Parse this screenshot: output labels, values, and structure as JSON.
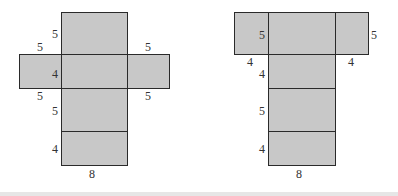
{
  "diagrams": [
    {
      "name": "net-left",
      "description": "Net of rectangular prism, cross shape",
      "fill_color": "#c8c8c8",
      "stroke_color": "#2a2a2a",
      "labels": {
        "top_height": "5",
        "left_top": "5",
        "right_top": "5",
        "middle_height": "4",
        "left_bottom": "5",
        "right_bottom": "5",
        "lower_height": "5",
        "bottom_height": "4",
        "base_width": "8"
      }
    },
    {
      "name": "net-right",
      "description": "Net of rectangular prism, T shape",
      "fill_color": "#c8c8c8",
      "stroke_color": "#2a2a2a",
      "labels": {
        "top_height_inner": "5",
        "top_height_right": "5",
        "left_flap_width": "4",
        "right_flap_width": "4",
        "second_height": "4",
        "third_height": "5",
        "bottom_height": "4",
        "base_width": "8"
      }
    }
  ]
}
